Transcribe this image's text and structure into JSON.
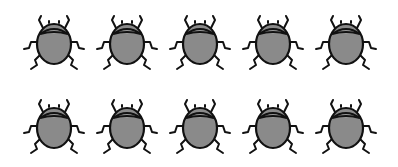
{
  "scene": {
    "description": "Two rows of five beetle illustrations",
    "icon": "beetle-icon",
    "colors": {
      "body": "#8a8a8a",
      "outline": "#111111",
      "background": "#ffffff"
    },
    "rows": [
      {
        "y": 12,
        "bugs": [
          {
            "x": 21
          },
          {
            "x": 94
          },
          {
            "x": 167
          },
          {
            "x": 240
          },
          {
            "x": 313
          }
        ]
      },
      {
        "y": 96,
        "bugs": [
          {
            "x": 21
          },
          {
            "x": 94
          },
          {
            "x": 167
          },
          {
            "x": 240
          },
          {
            "x": 313
          }
        ]
      }
    ],
    "count": 10
  }
}
